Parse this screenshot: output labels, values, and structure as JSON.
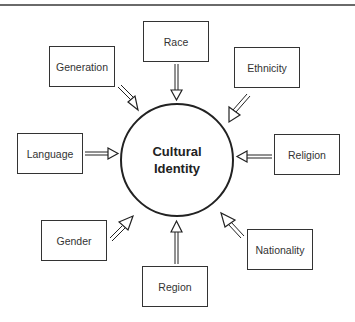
{
  "diagram": {
    "center": {
      "line1": "Cultural",
      "line2": "Identity"
    },
    "factors": {
      "race": "Race",
      "generation": "Generation",
      "ethnicity": "Ethnicity",
      "language": "Language",
      "religion": "Religion",
      "gender": "Gender",
      "nationality": "Nationality",
      "region": "Region"
    },
    "arrow_direction": "inward to center"
  }
}
